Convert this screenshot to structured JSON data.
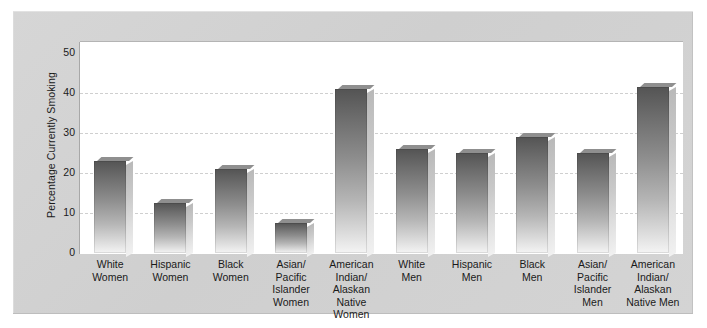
{
  "chart_data": {
    "type": "bar",
    "title": "",
    "xlabel": "",
    "ylabel": "Percentage Currently Smoking",
    "ylim": [
      0,
      50
    ],
    "ytick_labels": [
      "0",
      "10",
      "20",
      "30",
      "40",
      "50"
    ],
    "ytick_values": [
      0,
      10,
      20,
      30,
      40,
      50
    ],
    "grid": "horizontal dashed gridlines at 10, 20, 30, 40",
    "legend": "none",
    "categories": [
      "White Women",
      "Hispanic Women",
      "Black Women",
      "Asian/ Pacific Islander Women",
      "American Indian/ Alaskan Native Women",
      "White Men",
      "Hispanic Men",
      "Black Men",
      "Asian/ Pacific Islander Men",
      "American Indian/ Alaskan Native Men"
    ],
    "category_lines": [
      [
        "White",
        "Women"
      ],
      [
        "Hispanic",
        "Women"
      ],
      [
        "Black",
        "Women"
      ],
      [
        "Asian/",
        "Pacific",
        "Islander",
        "Women"
      ],
      [
        "American",
        "Indian/",
        "Alaskan",
        "Native",
        "Women"
      ],
      [
        "White",
        "Men"
      ],
      [
        "Hispanic",
        "Men"
      ],
      [
        "Black",
        "Men"
      ],
      [
        "Asian/",
        "Pacific",
        "Islander",
        "Men"
      ],
      [
        "American",
        "Indian/",
        "Alaskan",
        "Native Men"
      ]
    ],
    "values": [
      23,
      12.5,
      21,
      7.5,
      41,
      26,
      25,
      29,
      25,
      41.5
    ],
    "bar_color_top": "#545454",
    "bar_color_bottom": "#f4f4f4",
    "plot_background": "#ffffff",
    "panel_background": "#d2d2d2",
    "gridline_color": "#cfcfcf",
    "text_color": "#1a1a1a"
  }
}
